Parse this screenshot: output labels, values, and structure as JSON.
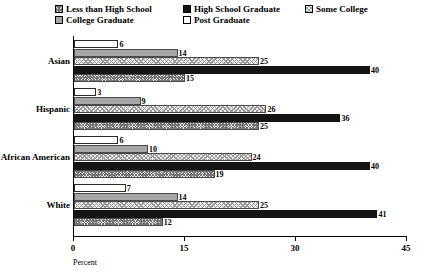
{
  "chart_data": {
    "type": "bar",
    "orientation": "horizontal",
    "title": "",
    "xlabel": "Percent",
    "ylabel": "",
    "xlim": [
      0,
      45
    ],
    "xticks": [
      0,
      15,
      30,
      45
    ],
    "grid": false,
    "legend_position": "top",
    "categories": [
      "Asian",
      "Hispanic",
      "African American",
      "White"
    ],
    "series": [
      {
        "name": "Less than High School",
        "pattern": "hatch",
        "values": [
          15,
          25,
          19,
          12
        ]
      },
      {
        "name": "High School Graduate",
        "pattern": "black",
        "values": [
          40,
          36,
          40,
          41
        ]
      },
      {
        "name": "Some College",
        "pattern": "light-hatch",
        "values": [
          25,
          26,
          24,
          25
        ]
      },
      {
        "name": "College Graduate",
        "pattern": "solid-gray",
        "values": [
          14,
          9,
          10,
          14
        ]
      },
      {
        "name": "Post Graduate",
        "pattern": "white",
        "values": [
          6,
          3,
          6,
          7
        ]
      }
    ]
  },
  "legend": {
    "items": [
      {
        "label": "Less than High School"
      },
      {
        "label": "College Graduate"
      },
      {
        "label": "High School Graduate"
      },
      {
        "label": "Post Graduate"
      },
      {
        "label": "Some College"
      }
    ]
  },
  "axis": {
    "x_title": "Percent",
    "x_tick_labels": [
      "0",
      "15",
      "30",
      "45"
    ]
  },
  "groups": [
    {
      "name": "Asian",
      "bars": [
        {
          "series": "Post Graduate",
          "value": "6"
        },
        {
          "series": "College Graduate",
          "value": "14"
        },
        {
          "series": "Some College",
          "value": "25"
        },
        {
          "series": "High School Graduate",
          "value": "40"
        },
        {
          "series": "Less than High School",
          "value": "15"
        }
      ]
    },
    {
      "name": "Hispanic",
      "bars": [
        {
          "series": "Post Graduate",
          "value": "3"
        },
        {
          "series": "College Graduate",
          "value": "9"
        },
        {
          "series": "Some College",
          "value": "26"
        },
        {
          "series": "High School Graduate",
          "value": "36"
        },
        {
          "series": "Less than High School",
          "value": "25"
        }
      ]
    },
    {
      "name": "African American",
      "bars": [
        {
          "series": "Post Graduate",
          "value": "6"
        },
        {
          "series": "College Graduate",
          "value": "10"
        },
        {
          "series": "Some College",
          "value": "24"
        },
        {
          "series": "High School Graduate",
          "value": "40"
        },
        {
          "series": "Less than High School",
          "value": "19"
        }
      ]
    },
    {
      "name": "White",
      "bars": [
        {
          "series": "Post Graduate",
          "value": "7"
        },
        {
          "series": "College Graduate",
          "value": "14"
        },
        {
          "series": "Some College",
          "value": "25"
        },
        {
          "series": "High School Graduate",
          "value": "41"
        },
        {
          "series": "Less than High School",
          "value": "12"
        }
      ]
    }
  ],
  "colors": {
    "bar_black": "#141414",
    "bar_gray": "#a6a6a6",
    "bar_white": "#ffffff",
    "axis": "#000000"
  }
}
